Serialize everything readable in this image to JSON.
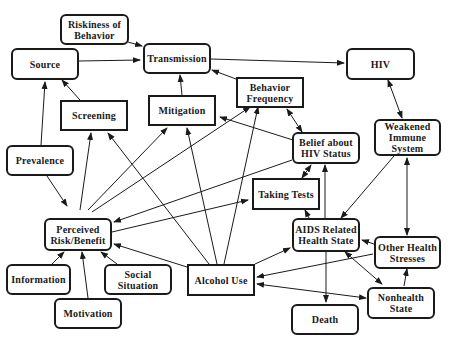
{
  "nodes": {
    "riskiness": {
      "label": "Riskiness of\nBehavior"
    },
    "source": {
      "label": "Source"
    },
    "transmission": {
      "label": "Transmission"
    },
    "hiv": {
      "label": "HIV"
    },
    "screening": {
      "label": "Screening"
    },
    "mitigation": {
      "label": "Mitigation"
    },
    "behavior_frequency": {
      "label": "Behavior\nFrequency"
    },
    "prevalence": {
      "label": "Prevalence"
    },
    "belief_hiv": {
      "label": "Belief about\nHIV Status"
    },
    "weakened_immune": {
      "label": "Weakened\nImmune\nSystem"
    },
    "taking_tests": {
      "label": "Taking Tests"
    },
    "perceived_risk": {
      "label": "Perceived\nRisk/Benefit"
    },
    "aids_health": {
      "label": "AIDS Related\nHealth State"
    },
    "other_stresses": {
      "label": "Other Health\nStresses"
    },
    "information": {
      "label": "Information"
    },
    "social_situation": {
      "label": "Social\nSituation"
    },
    "alcohol_use": {
      "label": "Alcohol Use"
    },
    "motivation": {
      "label": "Motivation"
    },
    "nonhealth": {
      "label": "Nonhealth\nState"
    },
    "death": {
      "label": "Death"
    }
  },
  "edges": [
    {
      "from": "Riskiness of Behavior",
      "to": "Transmission"
    },
    {
      "from": "Source",
      "to": "Transmission"
    },
    {
      "from": "Transmission",
      "to": "HIV"
    },
    {
      "from": "HIV",
      "to": "Weakened Immune System",
      "bidirectional": true
    },
    {
      "from": "Screening",
      "to": "Source"
    },
    {
      "from": "Prevalence",
      "to": "Source"
    },
    {
      "from": "Mitigation",
      "to": "Transmission"
    },
    {
      "from": "Behavior Frequency",
      "to": "Transmission"
    },
    {
      "from": "Prevalence",
      "to": "Perceived Risk/Benefit"
    },
    {
      "from": "Perceived Risk/Benefit",
      "to": "Screening"
    },
    {
      "from": "Perceived Risk/Benefit",
      "to": "Mitigation"
    },
    {
      "from": "Perceived Risk/Benefit",
      "to": "Behavior Frequency"
    },
    {
      "from": "Perceived Risk/Benefit",
      "to": "Taking Tests"
    },
    {
      "from": "Belief about HIV Status",
      "to": "Perceived Risk/Benefit"
    },
    {
      "from": "Belief about HIV Status",
      "to": "Mitigation"
    },
    {
      "from": "Belief about HIV Status",
      "to": "Behavior Frequency",
      "bidirectional": true
    },
    {
      "from": "Taking Tests",
      "to": "Belief about HIV Status",
      "bidirectional": true
    },
    {
      "from": "AIDS Related Health State",
      "to": "Belief about HIV Status"
    },
    {
      "from": "AIDS Related Health State",
      "to": "Taking Tests"
    },
    {
      "from": "Weakened Immune System",
      "to": "AIDS Related Health State"
    },
    {
      "from": "Weakened Immune System",
      "to": "Other Health Stresses",
      "bidirectional": true
    },
    {
      "from": "Other Health Stresses",
      "to": "AIDS Related Health State"
    },
    {
      "from": "AIDS Related Health State",
      "to": "Nonhealth State",
      "bidirectional": true
    },
    {
      "from": "Nonhealth State",
      "to": "Other Health Stresses"
    },
    {
      "from": "AIDS Related Health State",
      "to": "Death"
    },
    {
      "from": "Information",
      "to": "Perceived Risk/Benefit"
    },
    {
      "from": "Motivation",
      "to": "Perceived Risk/Benefit"
    },
    {
      "from": "Social Situation",
      "to": "Perceived Risk/Benefit"
    },
    {
      "from": "Alcohol Use",
      "to": "Perceived Risk/Benefit"
    },
    {
      "from": "Alcohol Use",
      "to": "Screening"
    },
    {
      "from": "Alcohol Use",
      "to": "Mitigation"
    },
    {
      "from": "Alcohol Use",
      "to": "Behavior Frequency"
    },
    {
      "from": "Alcohol Use",
      "to": "AIDS Related Health State"
    },
    {
      "from": "Other Health Stresses",
      "to": "Alcohol Use"
    },
    {
      "from": "Nonhealth State",
      "to": "Alcohol Use",
      "bidirectional": true
    }
  ]
}
